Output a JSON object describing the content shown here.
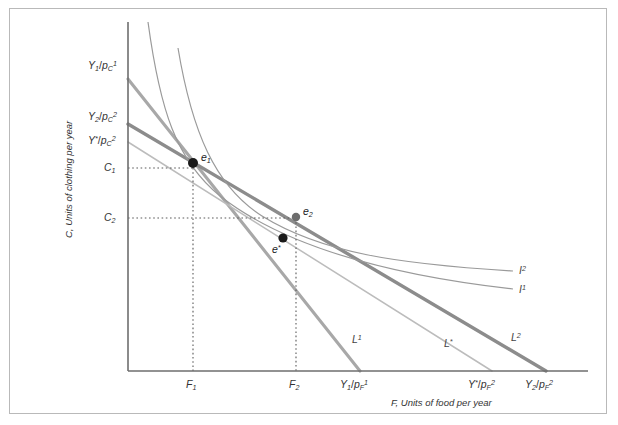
{
  "figure": {
    "axes": {
      "x_axis_title": "F, Units of food per year",
      "y_axis_title": "C, Units of clothing per year",
      "origin_px": [
        128,
        371
      ],
      "x_axis_end_px": [
        588,
        371
      ],
      "y_axis_top_px": [
        128,
        22
      ]
    },
    "y_tick_labels": [
      {
        "id": "C1",
        "text_main": "C",
        "sub": "1",
        "y_px": 168
      },
      {
        "id": "C2",
        "text_main": "C",
        "sub": "2",
        "y_px": 218
      }
    ],
    "x_tick_labels": [
      {
        "id": "F1",
        "text_main": "F",
        "sub": "1",
        "x_px": 193
      },
      {
        "id": "F2",
        "text_main": "F",
        "sub": "2",
        "x_px": 296
      }
    ],
    "y_intercept_labels": [
      {
        "id": "Y1_pC1",
        "num": "Y",
        "num_sub": "1",
        "den": "p",
        "den_sub": "C",
        "den_sup": "1",
        "y_px": 67
      },
      {
        "id": "Y2_pC2",
        "num": "Y",
        "num_sub": "2",
        "den": "p",
        "den_sub": "C",
        "den_sup": "2",
        "y_px": 118
      },
      {
        "id": "Ystar_pC2",
        "num": "Y",
        "num_sub": "*",
        "den": "p",
        "den_sub": "C",
        "den_sup": "2",
        "y_px": 142
      }
    ],
    "x_intercept_labels": [
      {
        "id": "Y1_pF1",
        "num": "Y",
        "num_sub": "1",
        "den": "p",
        "den_sub": "F",
        "den_sup": "1",
        "x_px": 355
      },
      {
        "id": "Ystar_pF2",
        "num": "Y",
        "num_sub": "*",
        "den": "p",
        "den_sub": "F",
        "den_sup": "2",
        "x_px": 487
      },
      {
        "id": "Y2_pF2",
        "num": "Y",
        "num_sub": "2",
        "den": "p",
        "den_sub": "F",
        "den_sup": "2",
        "x_px": 542
      }
    ],
    "budget_lines": [
      {
        "id": "L1",
        "label_main": "L",
        "label_sup": "1",
        "label_px": [
          352,
          340
        ],
        "color": "#a8a8a8",
        "width": 3.1,
        "from_px": [
          128,
          79
        ],
        "to_px": [
          360,
          371
        ]
      },
      {
        "id": "Lstar",
        "label_main": "L",
        "label_sup": "*",
        "label_px": [
          444,
          344
        ],
        "color": "#bcbcbc",
        "width": 1.5,
        "from_px": [
          128,
          142
        ],
        "to_px": [
          492,
          371
        ]
      },
      {
        "id": "L2",
        "label_main": "L",
        "label_sup": "2",
        "label_px": [
          511,
          338
        ],
        "color": "#8c8c8c",
        "width": 3.4,
        "from_px": [
          128,
          124
        ],
        "to_px": [
          546,
          371
        ]
      }
    ],
    "indifference_curves": [
      {
        "id": "I1",
        "label_main": "I",
        "label_sup": "1",
        "label_px": [
          519,
          284
        ],
        "color": "#9a9a9a",
        "width": 1.2,
        "path": "M 148 22 C 160 110, 176 160, 220 196 C 280 243, 380 274, 513 289"
      },
      {
        "id": "I2",
        "label_main": "I",
        "label_sup": "2",
        "label_px": [
          519,
          265
        ],
        "color": "#9a9a9a",
        "width": 1.2,
        "path": "M 178 48 C 192 132, 215 186, 262 216 C 322 253, 398 264, 513 271"
      }
    ],
    "points": [
      {
        "id": "e1",
        "label_main": "e",
        "label_sub": "1",
        "px": [
          193,
          163
        ],
        "label_px": [
          201,
          156
        ],
        "radius": 5.0
      },
      {
        "id": "e2",
        "label_main": "e",
        "label_sub": "2",
        "px": [
          296,
          217
        ],
        "label_px": [
          303,
          209
        ],
        "radius": 4.2
      },
      {
        "id": "estar",
        "label_main": "e",
        "label_sub": "*",
        "px": [
          283,
          238
        ],
        "label_px": [
          274,
          246
        ],
        "radius": 4.6
      }
    ],
    "guide_lines": [
      {
        "id": "guide-C1-e1-h",
        "from_px": [
          128,
          168
        ],
        "to_px": [
          193,
          168
        ]
      },
      {
        "id": "guide-F1-e1-v",
        "from_px": [
          193,
          168
        ],
        "to_px": [
          193,
          371
        ]
      },
      {
        "id": "guide-C2-e2-h",
        "from_px": [
          128,
          218
        ],
        "to_px": [
          296,
          218
        ]
      },
      {
        "id": "guide-F2-e2-v",
        "from_px": [
          296,
          218
        ],
        "to_px": [
          296,
          371
        ]
      }
    ],
    "colors": {
      "frame_border": "#b9b9b9",
      "axis": "#6e6e6e",
      "guide_dotted": "#5a5a5a",
      "point_fill": "#1a1a1a",
      "background": "#ffffff"
    }
  }
}
